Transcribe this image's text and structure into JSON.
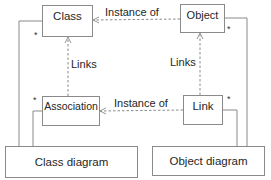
{
  "diagram": {
    "nodes": {
      "class": {
        "label": "Class"
      },
      "object": {
        "label": "Object"
      },
      "association": {
        "label": "Association"
      },
      "link": {
        "label": "Link"
      },
      "class_diagram": {
        "label": "Class diagram"
      },
      "object_diagram": {
        "label": "Object diagram"
      }
    },
    "edges": {
      "object_instance_of_class": {
        "label": "Instance of",
        "style": "dashed-arrow",
        "from": "Object",
        "to": "Class"
      },
      "link_instance_of_association": {
        "label": "Instance of",
        "style": "dashed-arrow",
        "from": "Link",
        "to": "Association"
      },
      "association_links_class": {
        "label": "Links",
        "style": "dashed-arrow",
        "from": "Association",
        "to": "Class"
      },
      "link_links_object": {
        "label": "Links",
        "style": "dashed-arrow",
        "from": "Link",
        "to": "Object"
      },
      "class_diagram_class": {
        "style": "solid",
        "from": "Class diagram",
        "to": "Class",
        "multiplicity": "*"
      },
      "class_diagram_association": {
        "style": "solid",
        "from": "Class diagram",
        "to": "Association",
        "multiplicity": "*"
      },
      "object_diagram_object": {
        "style": "solid",
        "from": "Object diagram",
        "to": "Object",
        "multiplicity": "*"
      },
      "object_diagram_link": {
        "style": "solid",
        "from": "Object diagram",
        "to": "Link",
        "multiplicity": "*"
      }
    },
    "multiplicity_symbol": "*",
    "colors": {
      "line": "#8a8a8a",
      "text": "#262626"
    }
  }
}
